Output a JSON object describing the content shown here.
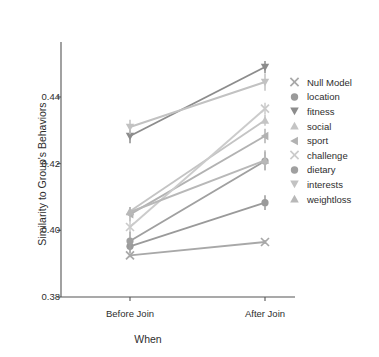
{
  "chart_data": {
    "type": "line",
    "title": "",
    "xlabel": "When",
    "ylabel": "Similarity to Group's Behaviors",
    "categories": [
      "Before Join",
      "After Join"
    ],
    "x": [
      0,
      1
    ],
    "ylim": [
      0.38,
      0.4565
    ],
    "yticks": [
      0.38,
      0.4,
      0.42,
      0.44
    ],
    "ytick_labels": [
      "0.38",
      "0.40",
      "0.42",
      "0.44"
    ],
    "xtick_labels": [
      "Before Join",
      "After Join"
    ],
    "grid": false,
    "legend_position": "right",
    "errorbars": true,
    "series": [
      {
        "name": "Null Model",
        "marker": "x",
        "color": "#a8a8a8",
        "values": [
          0.3925,
          0.3965
        ],
        "errors": [
          0.0006,
          0.0006
        ]
      },
      {
        "name": "location",
        "marker": "circle",
        "color": "#9a9a9a",
        "values": [
          0.3952,
          0.4083
        ],
        "errors": [
          0.002,
          0.0022
        ]
      },
      {
        "name": "fitness",
        "marker": "triangle-down",
        "color": "#8c8c8c",
        "values": [
          0.4283,
          0.449
        ],
        "errors": [
          0.0022,
          0.0018
        ]
      },
      {
        "name": "social",
        "marker": "triangle-up",
        "color": "#c4c4c4",
        "values": [
          0.4057,
          0.433
        ],
        "errors": [
          0.0013,
          0.0016
        ]
      },
      {
        "name": "sport",
        "marker": "triangle-left",
        "color": "#b2b2b2",
        "values": [
          0.4048,
          0.4283
        ],
        "errors": [
          0.0022,
          0.0022
        ]
      },
      {
        "name": "challenge",
        "marker": "x",
        "color": "#cbcbcb",
        "values": [
          0.401,
          0.4365
        ],
        "errors": [
          0.0016,
          0.0018
        ]
      },
      {
        "name": "dietary",
        "marker": "circle",
        "color": "#a0a0a0",
        "values": [
          0.3968,
          0.4208
        ],
        "errors": [
          0.0028,
          0.0028
        ]
      },
      {
        "name": "interests",
        "marker": "triangle-down",
        "color": "#c2c2c2",
        "values": [
          0.431,
          0.4445
        ],
        "errors": [
          0.0022,
          0.0026
        ]
      },
      {
        "name": "weightloss",
        "marker": "triangle-up",
        "color": "#b8b8b8",
        "values": [
          0.4055,
          0.421
        ],
        "errors": [
          0.0013,
          0.003
        ]
      }
    ]
  },
  "legend": {
    "items": [
      {
        "label": "Null Model"
      },
      {
        "label": "location"
      },
      {
        "label": "fitness"
      },
      {
        "label": "social"
      },
      {
        "label": "sport"
      },
      {
        "label": "challenge"
      },
      {
        "label": "dietary"
      },
      {
        "label": "interests"
      },
      {
        "label": "weightloss"
      }
    ]
  },
  "axes": {
    "spine_color": "#555555"
  }
}
